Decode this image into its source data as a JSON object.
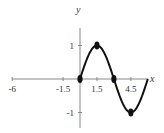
{
  "chart_data": {
    "type": "line",
    "title": "",
    "xlabel": "x",
    "ylabel": "y",
    "xlim": [
      -6,
      6
    ],
    "ylim": [
      -1.3,
      1.3
    ],
    "x_ticks": [
      -6,
      -1.5,
      1.5,
      4.5
    ],
    "x_tick_labels": [
      "-6",
      "-1.5",
      "1.5",
      "4.5"
    ],
    "y_ticks": [
      1,
      -1
    ],
    "y_tick_labels": [
      "1",
      "-1"
    ],
    "grid": false,
    "series": [
      {
        "name": "y = sin(πx/3)",
        "x": [
          0,
          0.75,
          1.5,
          2.25,
          3,
          3.75,
          4.5,
          5.25,
          6
        ],
        "y": [
          0,
          0.707,
          1,
          0.707,
          0,
          -0.707,
          -1,
          -0.707,
          0
        ]
      }
    ],
    "key_points": [
      {
        "x": 0,
        "y": 0
      },
      {
        "x": 1.5,
        "y": 1
      },
      {
        "x": 3,
        "y": 0
      },
      {
        "x": 4.5,
        "y": -1
      }
    ]
  }
}
